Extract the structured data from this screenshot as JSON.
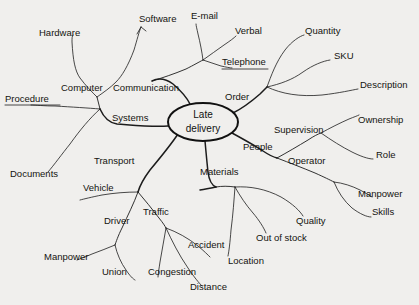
{
  "diagram": {
    "type": "cause-and-effect mind map",
    "background_color": "#f0efed",
    "ink_color": "#1c1c1c",
    "center": {
      "line1": "Late",
      "line2": "delivery",
      "cx": 203,
      "cy": 122,
      "rx": 35,
      "ry": 19
    },
    "labels": [
      {
        "id": "hardware",
        "text": "Hardware",
        "x": 39,
        "y": 33,
        "anchor": "start"
      },
      {
        "id": "software",
        "text": "Software",
        "x": 139,
        "y": 19,
        "anchor": "start"
      },
      {
        "id": "email",
        "text": "E-mail",
        "x": 191,
        "y": 16,
        "anchor": "start"
      },
      {
        "id": "verbal",
        "text": "Verbal",
        "x": 235,
        "y": 31,
        "anchor": "start"
      },
      {
        "id": "quantity",
        "text": "Quantity",
        "x": 305,
        "y": 31,
        "anchor": "start"
      },
      {
        "id": "telephone",
        "text": "Telephone",
        "x": 222,
        "y": 62,
        "anchor": "start"
      },
      {
        "id": "sku",
        "text": "SKU",
        "x": 334,
        "y": 56,
        "anchor": "start"
      },
      {
        "id": "computer",
        "text": "Computer",
        "x": 61,
        "y": 88,
        "anchor": "start"
      },
      {
        "id": "communication",
        "text": "Communication",
        "x": 113,
        "y": 88,
        "anchor": "start"
      },
      {
        "id": "description",
        "text": "Description",
        "x": 360,
        "y": 85,
        "anchor": "start"
      },
      {
        "id": "procedure",
        "text": "Procedure",
        "x": 5,
        "y": 99,
        "anchor": "start"
      },
      {
        "id": "order",
        "text": "Order",
        "x": 225,
        "y": 97,
        "anchor": "start"
      },
      {
        "id": "ownership",
        "text": "Ownership",
        "x": 358,
        "y": 120,
        "anchor": "start"
      },
      {
        "id": "systems",
        "text": "Systems",
        "x": 112,
        "y": 118,
        "anchor": "start"
      },
      {
        "id": "supervision",
        "text": "Supervision",
        "x": 274,
        "y": 130,
        "anchor": "start"
      },
      {
        "id": "people",
        "text": "People",
        "x": 243,
        "y": 147,
        "anchor": "start"
      },
      {
        "id": "role",
        "text": "Role",
        "x": 376,
        "y": 155,
        "anchor": "start"
      },
      {
        "id": "operator",
        "text": "Operator",
        "x": 288,
        "y": 161,
        "anchor": "start"
      },
      {
        "id": "documents",
        "text": "Documents",
        "x": 10,
        "y": 174,
        "anchor": "start"
      },
      {
        "id": "transport",
        "text": "Transport",
        "x": 94,
        "y": 161,
        "anchor": "start"
      },
      {
        "id": "materials",
        "text": "Materials",
        "x": 200,
        "y": 172,
        "anchor": "start"
      },
      {
        "id": "vehicle",
        "text": "Vehicle",
        "x": 83,
        "y": 188,
        "anchor": "start"
      },
      {
        "id": "manpower-r",
        "text": "Manpower",
        "x": 358,
        "y": 194,
        "anchor": "start"
      },
      {
        "id": "traffic",
        "text": "Traffic",
        "x": 143,
        "y": 212,
        "anchor": "start"
      },
      {
        "id": "driver",
        "text": "Driver",
        "x": 104,
        "y": 221,
        "anchor": "start"
      },
      {
        "id": "skills",
        "text": "Skills",
        "x": 372,
        "y": 212,
        "anchor": "start"
      },
      {
        "id": "quality",
        "text": "Quality",
        "x": 296,
        "y": 221,
        "anchor": "start"
      },
      {
        "id": "outofstock",
        "text": "Out of stock",
        "x": 256,
        "y": 238,
        "anchor": "start"
      },
      {
        "id": "accident",
        "text": "Accident",
        "x": 188,
        "y": 245,
        "anchor": "start"
      },
      {
        "id": "manpower-l",
        "text": "Manpower",
        "x": 44,
        "y": 257,
        "anchor": "start"
      },
      {
        "id": "location",
        "text": "Location",
        "x": 228,
        "y": 261,
        "anchor": "start"
      },
      {
        "id": "union",
        "text": "Union",
        "x": 102,
        "y": 272,
        "anchor": "start"
      },
      {
        "id": "congestion",
        "text": "Congestion",
        "x": 148,
        "y": 272,
        "anchor": "start"
      },
      {
        "id": "distance",
        "text": "Distance",
        "x": 190,
        "y": 287,
        "anchor": "start"
      }
    ],
    "paths": [
      {
        "id": "spine-systems",
        "kind": "spine",
        "d": "M 168 126 C 150 127, 132 125, 117 124 C 110 123, 104 118, 100 109"
      },
      {
        "id": "spine-communication",
        "kind": "spine",
        "d": "M 190 104 C 186 96, 180 90, 173 84 C 166 79, 158 78, 152 81"
      },
      {
        "id": "spine-order",
        "kind": "spine",
        "d": "M 233 113 C 243 108, 252 101, 260 94 C 263 91, 265 89, 267 87"
      },
      {
        "id": "spine-people",
        "kind": "spine",
        "d": "M 232 133 C 243 139, 254 145, 263 151 C 269 155, 273 157, 277 158"
      },
      {
        "id": "spine-materials",
        "kind": "spine",
        "d": "M 205 141 C 206 152, 207 163, 208 172 C 209 180, 211 185, 216 187"
      },
      {
        "id": "spine-transport",
        "kind": "spine",
        "d": "M 178 134 C 170 146, 160 158, 150 170 C 144 178, 140 185, 138 192"
      },
      {
        "id": "computer-junction",
        "kind": "branch",
        "d": "M 100 109 C 99 105, 98 101, 97 97"
      },
      {
        "id": "computer-hardware",
        "kind": "twig",
        "d": "M 97 97 C 92 92, 86 86, 80 78 C 75 71, 73 60, 72 42 C 72 38, 72 36, 73 35"
      },
      {
        "id": "computer-software",
        "kind": "twig",
        "d": "M 97 97 C 104 92, 110 88, 116 82 C 122 76, 128 66, 134 50 C 137 40, 139 32, 141 27"
      },
      {
        "id": "software-arrow1",
        "kind": "twig",
        "d": "M 141 27 L 137 34"
      },
      {
        "id": "software-arrow2",
        "kind": "twig",
        "d": "M 141 27 L 146 31"
      },
      {
        "id": "procedure-twig",
        "kind": "twig",
        "d": "M 100 109 C 88 108, 72 107, 55 106 C 44 106, 36 105, 31 105"
      },
      {
        "id": "documents-twig",
        "kind": "twig",
        "d": "M 100 109 C 90 118, 80 130, 70 144 C 62 154, 54 165, 48 172"
      },
      {
        "id": "comm-stem",
        "kind": "branch",
        "d": "M 152 81 C 162 78, 174 74, 186 69 C 194 65, 199 62, 203 60"
      },
      {
        "id": "comm-email",
        "kind": "twig",
        "d": "M 203 60 C 202 52, 200 42, 198 34 C 197 29, 196 26, 196 24"
      },
      {
        "id": "comm-verbal",
        "kind": "twig",
        "d": "M 203 60 C 210 55, 217 50, 224 45 C 230 41, 234 38, 236 36"
      },
      {
        "id": "comm-telephone",
        "kind": "twig",
        "d": "M 203 60 C 209 62, 215 64, 221 66 C 226 67, 230 68, 232 68"
      },
      {
        "id": "telephone-underline",
        "kind": "twig",
        "d": "M 222 69 L 268 69"
      },
      {
        "id": "procedure-underline",
        "kind": "twig",
        "d": "M 5 105 L 60 105"
      },
      {
        "id": "order-quantity",
        "kind": "twig",
        "d": "M 267 87 C 271 76, 276 62, 285 50 C 292 41, 300 36, 304 35"
      },
      {
        "id": "order-sku",
        "kind": "twig",
        "d": "M 267 87 C 280 84, 292 80, 303 72 C 313 65, 323 61, 330 60"
      },
      {
        "id": "order-description",
        "kind": "twig",
        "d": "M 267 87 C 282 94, 300 97, 322 95 C 340 93, 352 90, 358 89"
      },
      {
        "id": "people-supervision",
        "kind": "branch",
        "d": "M 277 158 C 288 152, 298 146, 308 140 C 314 136, 318 134, 321 133"
      },
      {
        "id": "sup-ownership",
        "kind": "twig",
        "d": "M 321 133 C 330 128, 340 123, 349 119 C 354 117, 357 116, 359 115"
      },
      {
        "id": "sup-role",
        "kind": "twig",
        "d": "M 321 133 C 331 140, 342 147, 352 152 C 360 156, 368 159, 373 159"
      },
      {
        "id": "people-operator",
        "kind": "branch",
        "d": "M 277 158 C 290 163, 303 168, 315 173 C 324 177, 330 180, 334 182"
      },
      {
        "id": "op-manpower",
        "kind": "twig",
        "d": "M 334 182 C 343 183, 352 186, 360 190 C 366 193, 370 196, 372 197"
      },
      {
        "id": "op-skills",
        "kind": "twig",
        "d": "M 334 182 C 338 192, 344 201, 352 208 C 360 214, 367 217, 371 217"
      },
      {
        "id": "materials-location",
        "kind": "twig",
        "d": "M 235 187 C 234 200, 233 215, 231 230 C 230 243, 229 251, 228 256"
      },
      {
        "id": "materials-oos",
        "kind": "twig",
        "d": "M 235 187 C 240 196, 246 205, 253 213 C 259 220, 264 228, 266 233"
      },
      {
        "id": "materials-quality",
        "kind": "twig",
        "d": "M 235 187 C 250 186, 266 189, 281 197 C 293 204, 300 211, 303 216"
      },
      {
        "id": "materials-stem",
        "kind": "branch",
        "d": "M 216 187 C 222 186, 228 186, 235 187"
      },
      {
        "id": "transport-vehicle",
        "kind": "twig",
        "d": "M 138 192 C 126 192, 114 193, 102 195 C 92 197, 84 199, 80 200"
      },
      {
        "id": "transport-driver",
        "kind": "branch",
        "d": "M 138 192 C 134 203, 128 215, 122 228 C 118 236, 116 242, 115 245"
      },
      {
        "id": "driver-manpower",
        "kind": "twig",
        "d": "M 115 245 C 108 248, 100 251, 92 254 C 85 257, 80 259, 77 260"
      },
      {
        "id": "driver-union",
        "kind": "twig",
        "d": "M 115 245 C 117 254, 121 263, 126 270 C 130 276, 133 279, 135 280"
      },
      {
        "id": "transport-traffic",
        "kind": "branch",
        "d": "M 138 192 C 145 200, 152 209, 159 218 C 163 223, 165 226, 166 228"
      },
      {
        "id": "traffic-congestion",
        "kind": "twig",
        "d": "M 166 228 C 164 239, 162 251, 160 262 C 159 269, 158 274, 158 277"
      },
      {
        "id": "traffic-distance",
        "kind": "twig",
        "d": "M 166 228 C 172 241, 179 255, 188 268 C 194 277, 199 283, 202 286"
      },
      {
        "id": "traffic-accident",
        "kind": "twig",
        "d": "M 166 228 C 177 232, 188 238, 198 246 C 204 251, 208 255, 210 257"
      },
      {
        "id": "materials-spine2",
        "kind": "spine",
        "d": "M 216 187 C 211 188, 206 189, 200 190"
      }
    ]
  }
}
